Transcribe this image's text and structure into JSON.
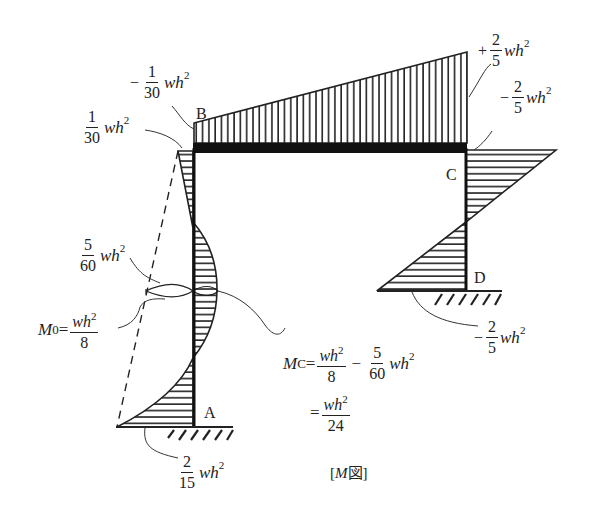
{
  "diagram": {
    "type": "bending-moment-diagram",
    "caption": "[M図]",
    "caption_italic": "M",
    "caption_suffix": "図",
    "nodes": [
      {
        "id": "A",
        "label": "A"
      },
      {
        "id": "B",
        "label": "B"
      },
      {
        "id": "C",
        "label": "C"
      },
      {
        "id": "D",
        "label": "D"
      }
    ],
    "members": [
      {
        "name": "column-AB",
        "from": "A",
        "to": "B"
      },
      {
        "name": "beam-BC",
        "from": "B",
        "to": "C"
      },
      {
        "name": "column-CD",
        "from": "C",
        "to": "D"
      }
    ],
    "supports": [
      {
        "node": "A",
        "type": "fixed"
      },
      {
        "node": "D",
        "type": "fixed"
      }
    ],
    "annotations": {
      "beam_left": {
        "sign": "−",
        "num": "1",
        "den": "30",
        "tail": "wh",
        "exp": "2"
      },
      "column_top_left": {
        "sign": "",
        "num": "1",
        "den": "30",
        "tail": "wh",
        "exp": "2"
      },
      "beam_right": {
        "sign": "+",
        "num": "2",
        "den": "5",
        "tail": "wh",
        "exp": "2"
      },
      "column_top_right": {
        "sign": "−",
        "num": "2",
        "den": "5",
        "tail": "wh",
        "exp": "2"
      },
      "column_mid_offset": {
        "sign": "",
        "num": "5",
        "den": "60",
        "tail": "wh",
        "exp": "2"
      },
      "m0": {
        "lhs": "M",
        "lhs_sub": "0",
        "eq": "=",
        "num": "wh",
        "num_exp": "2",
        "den": "8"
      },
      "base_right": {
        "sign": "−",
        "num": "2",
        "den": "5",
        "tail": "wh",
        "exp": "2"
      },
      "base_left": {
        "sign": "",
        "num": "2",
        "den": "15",
        "tail": "wh",
        "exp": "2"
      },
      "mc_line1": {
        "lhs": "M",
        "lhs_sub": "C",
        "eq": "=",
        "num1": "wh",
        "num1_exp": "2",
        "den1": "8",
        "minus": "−",
        "num2": "5",
        "den2": "60",
        "tail": "wh",
        "exp": "2"
      },
      "mc_line2": {
        "eq": "=",
        "num": "wh",
        "num_exp": "2",
        "den": "24"
      }
    },
    "colors": {
      "ink": "#222222",
      "background": "#ffffff"
    }
  }
}
